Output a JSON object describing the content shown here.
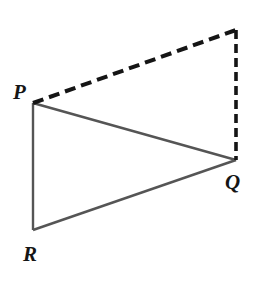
{
  "figure": {
    "canvas": {
      "width": 269,
      "height": 283,
      "background": "#ffffff"
    },
    "colors": {
      "solid_stroke": "#555555",
      "dashed_stroke": "#151515",
      "label_color": "#151515",
      "background": "#ffffff"
    },
    "vertices": [
      {
        "id": "P",
        "label": "P",
        "x": 33,
        "y": 103,
        "label_x": 13,
        "label_y": 82
      },
      {
        "id": "Q",
        "label": "Q",
        "x": 236,
        "y": 160,
        "label_x": 225,
        "label_y": 172
      },
      {
        "id": "R",
        "label": "R",
        "x": 33,
        "y": 230,
        "label_x": 23,
        "label_y": 244
      },
      {
        "id": "C",
        "label": "",
        "x": 236,
        "y": 30,
        "label_x": 0,
        "label_y": 0
      }
    ],
    "solid_edges": [
      {
        "name": "edge-P-Q",
        "from": "P",
        "to": "Q",
        "x1": 33,
        "y1": 103,
        "x2": 236,
        "y2": 160,
        "width": 2.4
      },
      {
        "name": "edge-P-R",
        "from": "P",
        "to": "R",
        "x1": 33,
        "y1": 103,
        "x2": 33,
        "y2": 230,
        "width": 2.4
      },
      {
        "name": "edge-R-Q",
        "from": "R",
        "to": "Q",
        "x1": 33,
        "y1": 230,
        "x2": 236,
        "y2": 160,
        "width": 2.4
      }
    ],
    "dashed_edges": [
      {
        "name": "edge-P-corner",
        "from": "P",
        "to": "C",
        "x1": 33,
        "y1": 103,
        "x2": 236,
        "y2": 30,
        "width": 4.0,
        "dash": "11 6"
      },
      {
        "name": "edge-corner-Q",
        "from": "C",
        "to": "Q",
        "x1": 236,
        "y1": 30,
        "x2": 236,
        "y2": 160,
        "width": 3.6,
        "dash": "9 5"
      }
    ]
  }
}
